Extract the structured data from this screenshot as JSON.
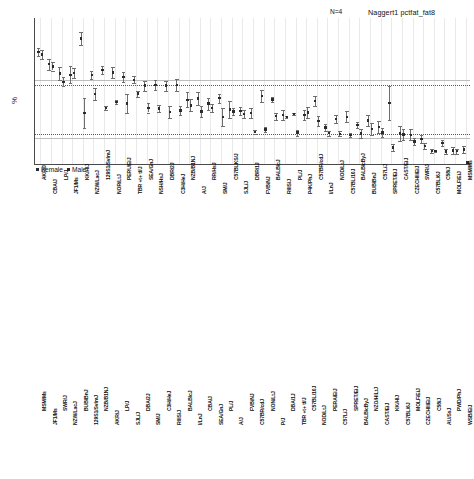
{
  "figure": {
    "ylabel": "%",
    "legend": {
      "female": "Female",
      "male": "Male"
    }
  },
  "panels": [
    {
      "id": "naggert1",
      "title": "Naggert1 pctfat_fat8",
      "n_label": "N=4",
      "ylabel": "%"
    },
    {
      "id": "tordoff3",
      "title": "Tordoff3 pct_fat",
      "n_label": "",
      "ylabel": "%"
    }
  ],
  "chart_data": [
    {
      "type": "scatter",
      "title": "Naggert1 pctfat_fat8",
      "subtitle": "N=4",
      "xlabel": "",
      "ylabel": "%",
      "ylim": [
        10,
        45
      ],
      "yticks": [
        10,
        15,
        20,
        25,
        30,
        35,
        40,
        45
      ],
      "grid": "vertical-light",
      "legend": [
        "Female",
        "Male"
      ],
      "legend_position": "bottom-left",
      "reference_lines": [
        {
          "value": 30.3,
          "style": "solid"
        },
        {
          "value": 29.0,
          "style": "dotted"
        },
        {
          "value": 17.5,
          "style": "dotted"
        },
        {
          "value": 16.4,
          "style": "solid"
        }
      ],
      "categories": [
        "AKR/J",
        "CBA/J",
        "LP/J",
        "JF1/Ms",
        "KK/HlJ",
        "NZW/LacJ",
        "129S1/SvImJ",
        "NOR/LtJ",
        "PERU/EiJ",
        "TBR +t+ tf/J",
        "SEA/GnJ",
        "NSH/HsJ",
        "DBR/2J",
        "C3H/HeJ",
        "NZB/B1NJ",
        "A/J",
        "RR/HsJ",
        "SM/J",
        "C57BLKS/J",
        "SJL/J",
        "DBR/1J",
        "FVB/NJ",
        "BALB/cJ",
        "RIIIS/J",
        "PL/J",
        "P4K/PhJ",
        "C57BR/cdJ",
        "I/LnJ",
        "NOD/LtJ",
        "C57BL/10J",
        "BALB/cByJ",
        "BUB/BnJ",
        "C57L/J",
        "SPRET/EiJ",
        "CAST/EiJ",
        "CZECHII/EiJ",
        "SWR/J",
        "C57BL/6J",
        "C58/J",
        "MOLF/EiJ",
        "MSM/Ms"
      ],
      "series": [
        {
          "name": "Female",
          "values": [
            36.9,
            34.0,
            31.8,
            31.5,
            40.1,
            31.4,
            32.6,
            32.0,
            31.0,
            30.3,
            28.9,
            29.1,
            28.9,
            29.0,
            25.5,
            25.8,
            24.6,
            25.9,
            23.2,
            22.9,
            22.4,
            26.4,
            25.6,
            21.9,
            22.2,
            21.9,
            25.3,
            18.9,
            21.0,
            21.5,
            19.5,
            20.6,
            19.0,
            24.7,
            17.5,
            17.2,
            16.2,
            13.4,
            15.2,
            13.5,
            13.7
          ],
          "errors": [
            1.0,
            1.3,
            1.6,
            2.0,
            1.6,
            1.0,
            1.0,
            1.3,
            1.2,
            0.8,
            1.2,
            1.2,
            1.2,
            1.4,
            1.8,
            1.6,
            1.4,
            1.1,
            2.0,
            0.9,
            1.2,
            1.4,
            0.6,
            1.1,
            0.3,
            1.3,
            1.2,
            0.8,
            1.0,
            1.3,
            0.8,
            1.2,
            1.4,
            4.1,
            1.7,
            1.3,
            1.0,
            0.5,
            0.7,
            0.8,
            0.9
          ]
        },
        {
          "name": "Male",
          "values": [
            36.3,
            33.5,
            29.8,
            31.9,
            22.4,
            26.9,
            23.6,
            25.0,
            24.6,
            27.0,
            23.6,
            23.5,
            22.6,
            23.0,
            24.2,
            22.7,
            23.6,
            21.4,
            22.7,
            22.2,
            17.9,
            18.5,
            21.6,
            21.4,
            17.7,
            22.5,
            20.5,
            17.6,
            17.4,
            17.1,
            17.5,
            18.6,
            17.7,
            14.2,
            17.3,
            15.6,
            14.5,
            13.3,
            13.2,
            13.3,
            10.6
          ],
          "errors": [
            1.0,
            1.0,
            1.1,
            1.2,
            3.5,
            1.4,
            0.5,
            0.5,
            2.2,
            0.7,
            1.1,
            0.9,
            1.5,
            1.0,
            1.4,
            1.3,
            1.0,
            2.1,
            0.8,
            1.0,
            0.4,
            0.6,
            0.9,
            0.3,
            0.7,
            1.4,
            1.2,
            0.6,
            0.6,
            0.5,
            1.0,
            1.5,
            1.1,
            0.9,
            1.3,
            0.8,
            0.8,
            0.2,
            0.5,
            0.6,
            0.2
          ]
        }
      ]
    },
    {
      "type": "scatter",
      "title": "Tordoff3 pct_fat",
      "subtitle": "",
      "xlabel": "",
      "ylabel": "%",
      "ylim": [
        15,
        50
      ],
      "yticks": [
        15,
        20,
        25,
        30,
        35,
        40,
        45,
        50
      ],
      "grid": "vertical-light",
      "legend": [
        "Female",
        "Male"
      ],
      "legend_position": "bottom-left",
      "reference_lines": [
        {
          "value": 32.5,
          "style": "dotted"
        },
        {
          "value": 31.6,
          "style": "solid"
        },
        {
          "value": 23.0,
          "style": "dotted"
        },
        {
          "value": 21.8,
          "style": "solid"
        }
      ],
      "categories": [
        "MSM/Ms",
        "JF1/Ms",
        "SWR/J",
        "NZW/LacJ",
        "BUB/BnJ",
        "129S1/SvImJ",
        "NZB/B1NJ",
        "AKR/J",
        "LP/J",
        "SJL/J",
        "DBA/2J",
        "SM/J",
        "C3H/HeJ",
        "RIIIS/J",
        "BALB/cJ",
        "I/LnJ",
        "CBA/J",
        "SEA/GnJ",
        "PL/J",
        "A/J",
        "FVB/NJ",
        "C57BR/cdJ",
        "NON/LtJ",
        "P/J",
        "DBA/1J",
        "TBR +t+ tf/J",
        "C57BL/10J",
        "NOD/LtJ",
        "PERA/EiJ",
        "C57L/J",
        "SPRET/EiJ",
        "BALB/cByJ",
        "NZO/HlLtJ",
        "CAST/EiJ",
        "KK/HlJ",
        "C57BL/6J",
        "MOLF/EiJ",
        "CZECHII/EiJ",
        "C58/J",
        "AU/SsJ",
        "PWD/PhJ",
        "WSB/EiJ"
      ],
      "series": [
        {
          "name": "Female",
          "values": [
            34.8,
            43.4,
            43.8,
            42.9,
            34.1,
            33.9,
            34.5,
            34.1,
            34.7,
            34.5,
            33.9,
            33.0,
            32.6,
            32.9,
            32.8,
            31.9,
            32.4,
            31.6,
            32.0,
            31.4,
            30.6,
            30.2,
            29.9,
            33.5,
            30.9,
            29.6,
            29.1,
            28.5,
            27.9,
            29.0,
            26.9,
            27.4,
            26.5,
            25.0,
            24.4,
            24.0,
            23.5,
            23.8,
            23.1,
            22.8,
            22.6,
            22.4
          ],
          "errors": [
            2.0,
            1.2,
            1.2,
            2.6,
            1.4,
            1.3,
            1.5,
            1.1,
            1.4,
            1.3,
            1.6,
            1.4,
            1.3,
            1.2,
            1.4,
            1.2,
            1.3,
            1.3,
            1.2,
            1.5,
            1.1,
            1.2,
            1.0,
            2.1,
            1.2,
            1.3,
            1.1,
            1.0,
            1.0,
            1.4,
            2.3,
            1.3,
            1.2,
            1.3,
            0.9,
            1.1,
            1.0,
            1.2,
            1.1,
            1.2,
            1.0,
            1.2
          ]
        },
        {
          "name": "Male",
          "values": [
            33.8,
            42.9,
            43.5,
            41.2,
            30.3,
            29.6,
            31.8,
            30.1,
            32.5,
            31.0,
            30.5,
            28.5,
            27.4,
            30.8,
            30.0,
            28.2,
            27.0,
            27.4,
            26.4,
            26.8,
            25.5,
            27.0,
            24.6,
            27.6,
            26.1,
            23.1,
            25.2,
            24.0,
            24.5,
            25.1,
            23.0,
            23.5,
            22.2,
            22.4,
            22.1,
            22.0,
            21.6,
            22.6,
            21.4,
            21.3,
            21.2,
            21.0
          ],
          "errors": [
            1.6,
            1.1,
            1.2,
            2.4,
            1.2,
            1.6,
            1.3,
            1.1,
            1.3,
            1.4,
            1.2,
            1.4,
            1.5,
            1.0,
            1.2,
            1.1,
            1.2,
            1.1,
            1.3,
            1.2,
            1.0,
            1.1,
            1.0,
            1.6,
            1.1,
            0.9,
            1.0,
            1.1,
            1.0,
            1.2,
            1.2,
            1.1,
            1.0,
            1.1,
            0.8,
            0.9,
            0.9,
            1.0,
            0.9,
            1.0,
            0.9,
            1.1
          ]
        }
      ]
    }
  ]
}
